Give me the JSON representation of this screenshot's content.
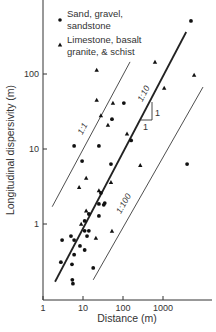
{
  "chart_data": {
    "type": "scatter",
    "title": "",
    "xlabel": "Distance (m)",
    "ylabel": "Longitudinal dispersivity (m)",
    "xscale": "log",
    "yscale": "log",
    "xlim": [
      1,
      30000
    ],
    "ylim": [
      0.1,
      1800
    ],
    "grid": false,
    "x_ticks": [
      1,
      10,
      100,
      1000
    ],
    "x_tick_labels": [
      "1",
      "10",
      "100",
      "1000"
    ],
    "y_ticks": [
      1,
      10,
      100
    ],
    "y_tick_labels": [
      "1",
      "10",
      "100"
    ],
    "legend_position": "upper left",
    "series": [
      {
        "name": "Sand, gravel, sandstone",
        "legend_lines": [
          "Sand, gravel,",
          "sandstone"
        ],
        "marker": "circle",
        "points": [
          [
            5000,
            510
          ],
          [
            105,
            41
          ],
          [
            53,
            25
          ],
          [
            160,
            13
          ],
          [
            6,
            11
          ],
          [
            25,
            11
          ],
          [
            9.5,
            6.9
          ],
          [
            50,
            6.3
          ],
          [
            4000,
            6.3
          ],
          [
            28,
            2.6
          ],
          [
            25,
            1.85
          ],
          [
            35,
            1.9
          ],
          [
            33,
            1.8
          ],
          [
            14,
            1.36
          ],
          [
            25,
            1.28
          ],
          [
            11,
            1.1
          ],
          [
            11,
            0.81
          ],
          [
            14,
            0.81
          ],
          [
            3,
            0.61
          ],
          [
            5,
            0.69
          ],
          [
            6,
            0.61
          ],
          [
            12.6,
            0.69
          ],
          [
            8.4,
            0.51
          ],
          [
            11,
            0.45
          ],
          [
            6,
            0.39
          ],
          [
            2.8,
            0.31
          ],
          [
            5.3,
            0.29
          ],
          [
            18,
            0.26
          ],
          [
            5.4,
            0.18
          ],
          [
            5.6,
            0.16
          ]
        ]
      },
      {
        "name": "Limestone, basalt granite, & schist",
        "legend_lines": [
          "Limestone, basalt",
          "granite, & schist"
        ],
        "marker": "triangle",
        "points": [
          [
            22,
            113
          ],
          [
            630,
            145
          ],
          [
            6000,
            97
          ],
          [
            22,
            45
          ],
          [
            56,
            41
          ],
          [
            1070,
            65
          ],
          [
            28,
            28
          ],
          [
            42,
            21
          ],
          [
            126,
            16
          ],
          [
            270,
            6.1
          ],
          [
            12,
            4.1
          ],
          [
            50,
            3.6
          ],
          [
            8,
            3.1
          ],
          [
            25,
            2.8
          ],
          [
            12,
            1.5
          ],
          [
            9,
            1.0
          ],
          [
            21,
            0.65
          ],
          [
            53,
            0.81
          ]
        ]
      }
    ],
    "reference_lines": [
      {
        "label": "1:1",
        "ratio": 1,
        "from": [
          1.7,
          1.7
        ],
        "to": [
          150,
          145
        ],
        "style": "thin"
      },
      {
        "label": "1:10",
        "ratio": 0.1,
        "from": [
          2,
          0.17
        ],
        "to": [
          3800,
          363
        ],
        "style": "bold"
      },
      {
        "label": "1:100",
        "ratio": 0.01,
        "from": [
          18,
          0.18
        ],
        "to": [
          10000,
          67
        ],
        "style": "thin"
      }
    ],
    "annotations": [
      {
        "type": "slope-triangle",
        "labels": [
          "1",
          "1"
        ],
        "note": "unit slope indicator on 1:10 line"
      }
    ]
  }
}
